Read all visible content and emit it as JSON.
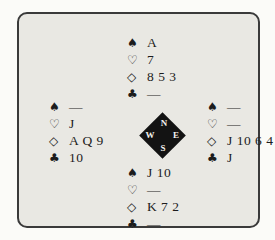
{
  "colors": {
    "page_bg": "#fbfbf8",
    "panel_bg": "#e9e8e3",
    "panel_border": "#3a3a3a",
    "text": "#1c1c1c",
    "compass_bg": "#131313",
    "compass_text": "#f4f3ee"
  },
  "compass": {
    "north_label": "N",
    "east_label": "E",
    "south_label": "S",
    "west_label": "W"
  },
  "hands": {
    "north": {
      "rows": [
        {
          "suit": "spades",
          "symbol": "♠",
          "cards": "A"
        },
        {
          "suit": "hearts",
          "symbol": "♡",
          "cards": "7"
        },
        {
          "suit": "diamonds",
          "symbol": "◇",
          "cards": "8 5 3"
        },
        {
          "suit": "clubs",
          "symbol": "♣",
          "cards": "—"
        }
      ]
    },
    "west": {
      "rows": [
        {
          "suit": "spades",
          "symbol": "♠",
          "cards": "—"
        },
        {
          "suit": "hearts",
          "symbol": "♡",
          "cards": "J"
        },
        {
          "suit": "diamonds",
          "symbol": "◇",
          "cards": "A Q 9"
        },
        {
          "suit": "clubs",
          "symbol": "♣",
          "cards": "10"
        }
      ]
    },
    "east": {
      "rows": [
        {
          "suit": "spades",
          "symbol": "♠",
          "cards": "—"
        },
        {
          "suit": "hearts",
          "symbol": "♡",
          "cards": "—"
        },
        {
          "suit": "diamonds",
          "symbol": "◇",
          "cards": "J 10 6 4"
        },
        {
          "suit": "clubs",
          "symbol": "♣",
          "cards": "J"
        }
      ]
    },
    "south": {
      "rows": [
        {
          "suit": "spades",
          "symbol": "♠",
          "cards": "J 10"
        },
        {
          "suit": "hearts",
          "symbol": "♡",
          "cards": "—"
        },
        {
          "suit": "diamonds",
          "symbol": "◇",
          "cards": "K 7 2"
        },
        {
          "suit": "clubs",
          "symbol": "♣",
          "cards": "—"
        }
      ]
    }
  }
}
